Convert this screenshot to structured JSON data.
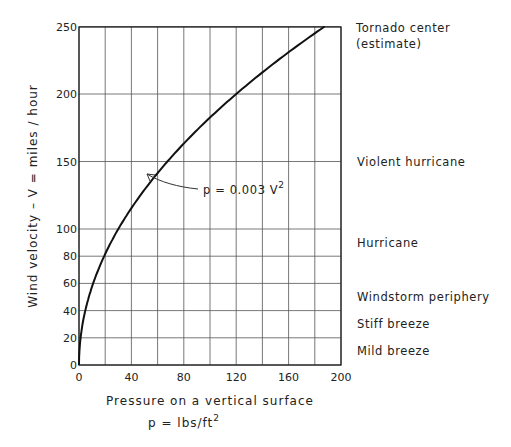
{
  "chart_data": {
    "type": "line",
    "title": "",
    "xlabel": "Pressure on a vertical surface",
    "xlabel_sub": "p = lbs/ft",
    "xlabel_sub_sup": "2",
    "ylabel": "Wind velocity  –  V  =  miles/hour",
    "xlim": [
      0,
      200
    ],
    "ylim": [
      0,
      250
    ],
    "grid": true,
    "x_ticks": [
      0,
      40,
      80,
      120,
      160,
      200
    ],
    "x_gridlines": [
      0,
      20,
      40,
      60,
      80,
      100,
      120,
      140,
      160,
      180,
      200
    ],
    "y_ticks": [
      0,
      20,
      40,
      60,
      80,
      100,
      150,
      200,
      250
    ],
    "y_axis_note": "piecewise linear scale: 20 mph steps up to 100, then 50 mph steps to 250",
    "series": [
      {
        "name": "p = 0.003 V^2",
        "equation": "p = 0.003 V^2",
        "x": [
          0,
          0.3,
          1.2,
          2.7,
          4.8,
          7.5,
          10.8,
          14.7,
          19.2,
          24.3,
          30,
          37.5,
          48,
          60,
          75,
          90,
          108,
          120,
          135,
          150,
          168,
          187.5
        ],
        "y": [
          0,
          10,
          20,
          30,
          40,
          50,
          60,
          70,
          80,
          90,
          100,
          111.8,
          126.5,
          141.4,
          158.1,
          173.2,
          189.7,
          200,
          212.1,
          223.6,
          236.6,
          250
        ]
      }
    ],
    "annotations": [
      {
        "text": "p  =  0.003 V",
        "sup": "2",
        "arrow_to": {
          "x": 48,
          "y": 126
        }
      }
    ],
    "category_labels": [
      {
        "text": "Tornado center",
        "y": 250
      },
      {
        "text": "(estimate)",
        "y": 250
      },
      {
        "text": "Violent hurricane",
        "y": 150
      },
      {
        "text": "Hurricane",
        "y": 90
      },
      {
        "text": "Windstorm periphery",
        "y": 50
      },
      {
        "text": "Stiff breeze",
        "y": 30
      },
      {
        "text": "Mild breeze",
        "y": 10
      }
    ]
  },
  "labels": {
    "x_title": "Pressure on a vertical surface",
    "x_sub": "p  =   lbs/ft",
    "x_sub_sup": "2",
    "y_title": "Wind velocity   –   V  =  miles / hour",
    "equation": "p  =  0.003 V",
    "equation_sup": "2",
    "tornado_1": "Tornado center",
    "tornado_2": "(estimate)",
    "violent": "Violent hurricane",
    "hurricane": "Hurricane",
    "windstorm": "Windstorm periphery",
    "stiff": "Stiff breeze",
    "mild": "Mild breeze"
  }
}
